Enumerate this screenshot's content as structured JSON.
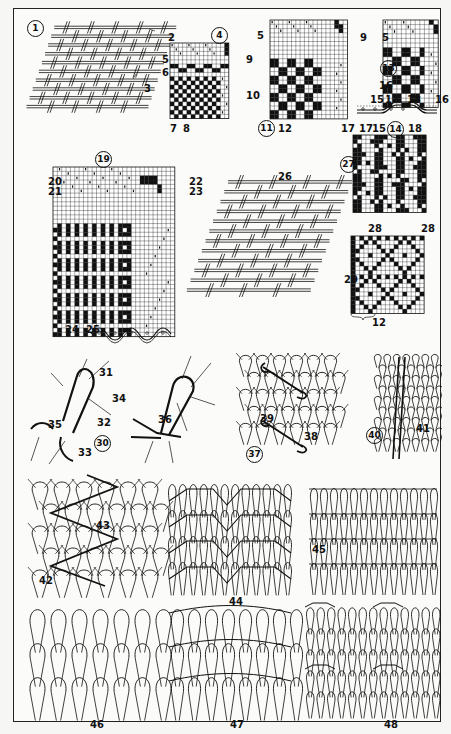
{
  "plate": {
    "frame_color": "#222222",
    "ink_color": "#111111",
    "paper_color": "#fbfbf9"
  },
  "figures": {
    "fig1": {
      "number": "1",
      "callouts": [
        "2",
        "3"
      ],
      "kind": "plain weave fabric"
    },
    "fig4": {
      "number": "4",
      "callouts": [
        "5",
        "6",
        "9",
        "10",
        "7",
        "8"
      ],
      "kind": "weave draft"
    },
    "fig11": {
      "number": "11",
      "callouts": [
        "5",
        "9",
        "12",
        "17"
      ],
      "kind": "weave draft"
    },
    "fig13": {
      "number": "13",
      "callouts": [
        "5",
        "16",
        "15",
        "17",
        "18"
      ],
      "kind": "weave draft"
    },
    "fig14": {
      "number": "14",
      "callouts": [
        "16",
        "17",
        "15",
        "18"
      ],
      "kind": "cross section"
    },
    "fig19": {
      "number": "19",
      "callouts": [
        "20",
        "21",
        "22",
        "23",
        "24",
        "25"
      ],
      "kind": "weave draft"
    },
    "fig26": {
      "callout": "26",
      "kind": "twill fabric"
    },
    "fig27": {
      "number": "27",
      "callouts": [
        "28",
        "28"
      ],
      "kind": "weave pattern"
    },
    "fig29": {
      "callouts": [
        "29",
        "12"
      ],
      "kind": "weave pattern"
    },
    "fig30": {
      "number": "30",
      "callouts": [
        "31",
        "34",
        "32",
        "35",
        "33"
      ],
      "kind": "knit loop"
    },
    "fig36": {
      "callout": "36",
      "kind": "knit loop"
    },
    "fig37": {
      "number": "37",
      "callouts": [
        "39",
        "38"
      ],
      "kind": "knit structure"
    },
    "fig40": {
      "number": "40",
      "callouts": [
        "41"
      ],
      "kind": "knit structure"
    },
    "fig42": {
      "callouts": [
        "42",
        "43"
      ],
      "kind": "knit structure"
    },
    "fig44": {
      "callout": "44",
      "kind": "knit structure"
    },
    "fig45": {
      "callout": "45",
      "kind": "knit structure"
    },
    "fig46": {
      "callout": "46",
      "kind": "knit structure"
    },
    "fig47": {
      "callout": "47",
      "kind": "knit structure"
    },
    "fig48": {
      "callout": "48",
      "kind": "knit structure"
    }
  }
}
